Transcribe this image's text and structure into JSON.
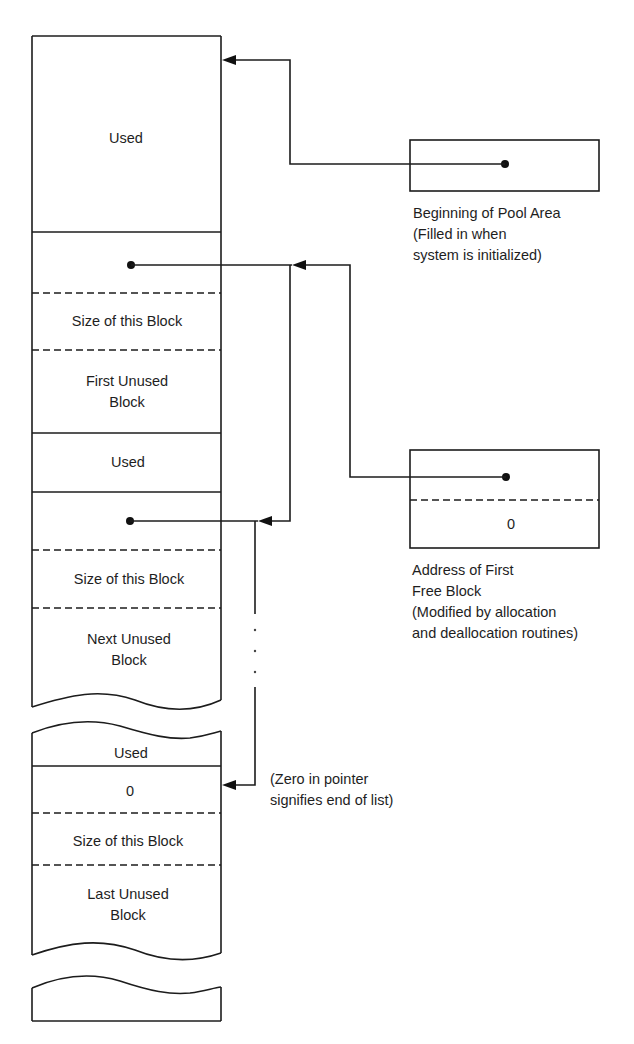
{
  "diagram": {
    "colors": {
      "line": "#1c1c1c",
      "text": "#1e1e1e",
      "background": "#ffffff"
    },
    "memory_column": {
      "blocks": [
        {
          "id": "used-1",
          "label": "Used"
        },
        {
          "id": "free-1",
          "pointer": "dot",
          "size_label": "Size of this Block",
          "body_label_line1": "First Unused",
          "body_label_line2": "Block"
        },
        {
          "id": "used-2",
          "label": "Used"
        },
        {
          "id": "free-2",
          "pointer": "dot",
          "size_label": "Size of this Block",
          "body_label_line1": "Next Unused",
          "body_label_line2": "Block"
        },
        {
          "id": "used-3",
          "label": "Used"
        },
        {
          "id": "free-last",
          "pointer_value": "0",
          "size_label": "Size of this Block",
          "body_label_line1": "Last Unused",
          "body_label_line2": "Block"
        }
      ]
    },
    "pool_pointer": {
      "caption_line1": "Beginning of Pool Area",
      "caption_line2": "(Filled in when",
      "caption_line3": "system is initialized)"
    },
    "free_list_head": {
      "lower_value": "0",
      "caption_line1": "Address of First",
      "caption_line2": "Free Block",
      "caption_line3": "(Modified by allocation",
      "caption_line4": "and deallocation routines)"
    },
    "end_note": {
      "line1": "(Zero in pointer",
      "line2": "signifies end of list)"
    },
    "ellipsis": ". . ."
  }
}
